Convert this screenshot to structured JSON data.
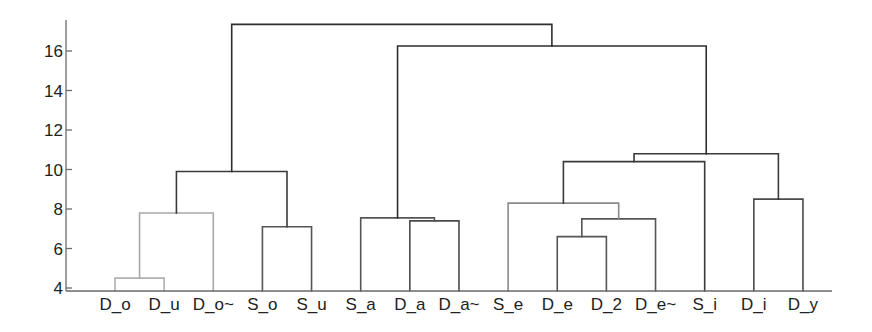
{
  "chart_data": {
    "type": "dendrogram",
    "title": "",
    "xlabel": "",
    "ylabel": "",
    "ylim": [
      4,
      17.6
    ],
    "yticks": [
      4,
      6,
      8,
      10,
      12,
      14,
      16
    ],
    "grid": false,
    "legend": null,
    "leaves": [
      "D_o",
      "D_u",
      "D_o~",
      "S_o",
      "S_u",
      "S_a",
      "D_a",
      "D_a~",
      "S_e",
      "D_e",
      "D_2",
      "D_e~",
      "S_i",
      "D_i",
      "D_y"
    ],
    "merges": [
      {
        "id": "c1",
        "left": "D_o",
        "right": "D_u",
        "height": 4.5,
        "color": "#b0b0b0"
      },
      {
        "id": "c2",
        "left": "c1",
        "right": "D_o~",
        "height": 7.8,
        "color": "#a8a8a8"
      },
      {
        "id": "c3",
        "left": "S_o",
        "right": "S_u",
        "height": 7.1,
        "color": "#555555"
      },
      {
        "id": "c4",
        "left": "c2",
        "right": "c3",
        "height": 9.9,
        "color": "#3a3a3a"
      },
      {
        "id": "c5",
        "left": "D_a",
        "right": "D_a~",
        "height": 7.4,
        "color": "#4a4a4a"
      },
      {
        "id": "c6",
        "left": "S_a",
        "right": "c5",
        "height": 7.55,
        "color": "#555555"
      },
      {
        "id": "c7",
        "left": "D_e",
        "right": "D_2",
        "height": 6.6,
        "color": "#555555"
      },
      {
        "id": "c8",
        "left": "c7",
        "right": "D_e~",
        "height": 7.5,
        "color": "#555555"
      },
      {
        "id": "c9",
        "left": "S_e",
        "right": "c8",
        "height": 8.3,
        "color": "#8a8a8a"
      },
      {
        "id": "c10",
        "left": "c9",
        "right": "S_i",
        "height": 10.4,
        "color": "#3a3a3a"
      },
      {
        "id": "c11",
        "left": "D_i",
        "right": "D_y",
        "height": 8.5,
        "color": "#4a4a4a"
      },
      {
        "id": "c12",
        "left": "c10",
        "right": "c11",
        "height": 10.8,
        "color": "#3a3a3a"
      },
      {
        "id": "c13",
        "left": "c6",
        "right": "c12",
        "height": 16.25,
        "color": "#2e2e2e"
      },
      {
        "id": "c14",
        "left": "c4",
        "right": "c13",
        "height": 17.35,
        "color": "#2e2e2e"
      }
    ]
  },
  "layout": {
    "axis_x": 66,
    "axis_y_top": 20,
    "baseline_y": 291,
    "axis_x_end": 832,
    "y_at_4": 288,
    "px_per_unit": 19.75,
    "first_leaf_x": 115,
    "leaf_spacing": 49.14,
    "label_y": 310
  }
}
